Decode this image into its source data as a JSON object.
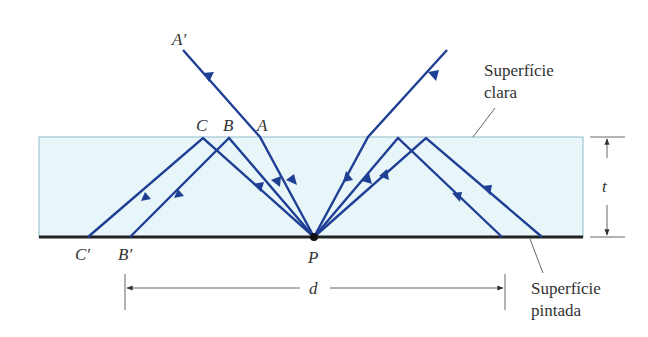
{
  "figure": {
    "labels": {
      "a_prime": "A′",
      "a": "A",
      "b": "B",
      "c": "C",
      "b_prime": "B′",
      "c_prime": "C′",
      "p": "P",
      "t": "t",
      "d": "d"
    },
    "callouts": {
      "clear_surface_line1": "Superfície",
      "clear_surface_line2": "clara",
      "painted_surface_line1": "Superfície",
      "painted_surface_line2": "pintada"
    },
    "colors": {
      "slab_fill": "#e8f6fa",
      "slab_border": "#8fbcc8",
      "ray": "#1f3f94",
      "painted_surface": "#222222",
      "dimension": "#555555"
    }
  }
}
